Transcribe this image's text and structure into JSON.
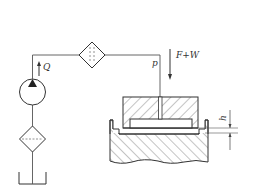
{
  "diagram": {
    "type": "hydrostatic bearing schematic",
    "colors": {
      "line": "#333333",
      "background": "#ffffff",
      "hatch": "#555555"
    },
    "labels": {
      "flow": "Q",
      "pressure": "p",
      "load": "F+W",
      "gap": "h"
    },
    "components": [
      {
        "id": "tank",
        "name": "oil reservoir"
      },
      {
        "id": "filter-lower",
        "name": "suction filter"
      },
      {
        "id": "pump",
        "name": "hydraulic pump"
      },
      {
        "id": "filter-upper",
        "name": "pressure filter"
      },
      {
        "id": "slider",
        "name": "upper pad (slider) with oil recess"
      },
      {
        "id": "base",
        "name": "guideway base"
      }
    ]
  }
}
